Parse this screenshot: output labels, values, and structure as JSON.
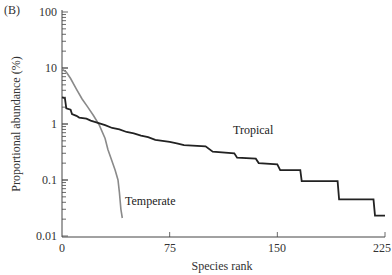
{
  "chart_data": {
    "type": "line",
    "panel_label": "(B)",
    "title": "",
    "xlabel": "Species rank",
    "ylabel": "Proportional abundance (%)",
    "yscale": "log",
    "xlim": [
      0,
      225
    ],
    "ylim": [
      0.01,
      100
    ],
    "x_ticks": [
      "0",
      "75",
      "150",
      "225"
    ],
    "y_ticks": [
      "0.01",
      "0.1",
      "1",
      "10",
      "100"
    ],
    "grid": false,
    "legend": "inline labels",
    "series": [
      {
        "name": "Tropical",
        "color": "#222222",
        "points": [
          [
            0,
            3.0
          ],
          [
            2,
            2.9
          ],
          [
            3,
            1.9
          ],
          [
            6,
            1.8
          ],
          [
            7,
            1.5
          ],
          [
            10,
            1.4
          ],
          [
            12,
            1.3
          ],
          [
            17,
            1.25
          ],
          [
            20,
            1.15
          ],
          [
            25,
            1.05
          ],
          [
            30,
            0.95
          ],
          [
            35,
            0.85
          ],
          [
            40,
            0.8
          ],
          [
            45,
            0.72
          ],
          [
            50,
            0.68
          ],
          [
            55,
            0.62
          ],
          [
            60,
            0.58
          ],
          [
            65,
            0.52
          ],
          [
            70,
            0.5
          ],
          [
            75,
            0.48
          ],
          [
            80,
            0.45
          ],
          [
            85,
            0.42
          ],
          [
            100,
            0.4
          ],
          [
            105,
            0.32
          ],
          [
            120,
            0.3
          ],
          [
            122,
            0.25
          ],
          [
            135,
            0.24
          ],
          [
            137,
            0.2
          ],
          [
            150,
            0.19
          ],
          [
            152,
            0.15
          ],
          [
            166,
            0.15
          ],
          [
            167,
            0.095
          ],
          [
            192,
            0.095
          ],
          [
            193,
            0.045
          ],
          [
            217,
            0.045
          ],
          [
            218,
            0.023
          ],
          [
            225,
            0.023
          ]
        ]
      },
      {
        "name": "Temperate",
        "color": "#8a8a8a",
        "points": [
          [
            0,
            9.5
          ],
          [
            3,
            8.5
          ],
          [
            6,
            6.5
          ],
          [
            10,
            4.2
          ],
          [
            14,
            2.8
          ],
          [
            18,
            2.0
          ],
          [
            22,
            1.4
          ],
          [
            26,
            0.95
          ],
          [
            30,
            0.55
          ],
          [
            32,
            0.35
          ],
          [
            34,
            0.25
          ],
          [
            37,
            0.15
          ],
          [
            39,
            0.1
          ],
          [
            40,
            0.06
          ],
          [
            41,
            0.03
          ],
          [
            42,
            0.021
          ]
        ]
      }
    ],
    "annotations": [
      {
        "text": "Tropical",
        "x": 118,
        "y": 0.42
      },
      {
        "text": "Temperate",
        "x": 45,
        "y": 0.045
      }
    ]
  },
  "labels": {
    "panel": "(B)",
    "xlabel": "Species rank",
    "ylabel": "Proportional abundance (%)",
    "tropical": "Tropical",
    "temperate": "Temperate",
    "xticks": [
      "0",
      "75",
      "150",
      "225"
    ],
    "yticks": [
      "0.01",
      "0.1",
      "1",
      "10",
      "100"
    ]
  }
}
